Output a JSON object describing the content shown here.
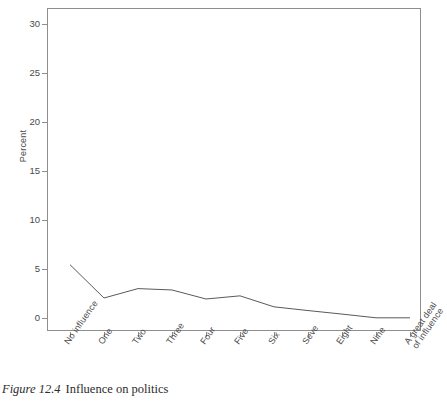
{
  "caption": {
    "label": "Figure 12.4",
    "text": "Influence on politics"
  },
  "chart_data": {
    "type": "line",
    "title": "",
    "subtitle": "",
    "xlabel": "",
    "ylabel": "Percent",
    "categories": [
      "No influence",
      "One",
      "Two",
      "Three",
      "Four",
      "Five",
      "Six",
      "Seve",
      "Eight",
      "Nine",
      "A great deal\nof influence"
    ],
    "values": [
      27.2,
      10.2,
      15.0,
      14.3,
      9.7,
      11.3,
      5.7,
      3.8,
      2.0,
      0.1,
      0.1
    ],
    "ylim": [
      0,
      31.5
    ],
    "yticks": [
      0,
      5,
      10,
      15,
      20,
      25,
      30
    ],
    "ytick_labels": [
      "0",
      "5",
      "10",
      "15",
      "20",
      "25",
      "30"
    ],
    "grid": false,
    "legend": false,
    "legend_position": "none",
    "line_color": "#5a5a5a",
    "frame_color": "#8e8e8e",
    "background_color": "#ffffff"
  },
  "axis": {
    "x_tick_labels": [
      "No influence",
      "One",
      "Two",
      "Three",
      "Four",
      "Five",
      "Six",
      "Seve",
      "Eight",
      "Nine",
      "A great deal of influence"
    ],
    "x_tick_last_line1": "A great deal",
    "x_tick_last_line2": "of influence",
    "y_tick_labels": [
      "30",
      "25",
      "20",
      "15",
      "10",
      "5",
      "0"
    ],
    "y_title": "Percent"
  }
}
